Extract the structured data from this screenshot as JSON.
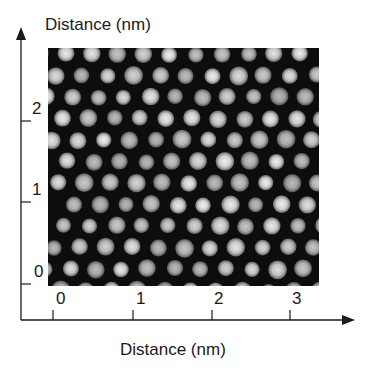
{
  "figure": {
    "y_axis_title": "Distance (nm)",
    "x_axis_title": "Distance (nm)",
    "x_ticks": [
      "0",
      "1",
      "2",
      "3"
    ],
    "y_ticks": [
      "0",
      "1",
      "2"
    ],
    "image_description": "STM-like image of hexagonally packed bright spots on dark background",
    "colors": {
      "background": "#0d0d0d",
      "spot": "#d9d9d9",
      "axis": "#1a1a1a"
    }
  }
}
